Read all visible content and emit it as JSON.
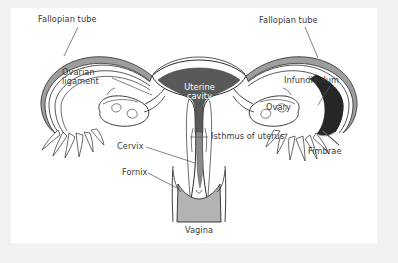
{
  "figure": {
    "kind": "anatomical-diagram",
    "background_color": "#f2f2f2",
    "paper_color": "#ffffff",
    "label_color": "#3a3a3a",
    "leader_color": "#5a5a5a",
    "outline_color": "#2b2b2b"
  },
  "labels": {
    "fallopian_tube_left": "Fallopian tube",
    "fallopian_tube_right": "Fallopian tube",
    "ovarian_ligament": "Ovarian\nligament",
    "ovarian_ligament_line1": "Ovarian",
    "ovarian_ligament_line2": "ligament",
    "uterine_cavity_line1": "Uterine",
    "uterine_cavity_line2": "cavity",
    "infundibulum": "Infundibulum",
    "ovary": "Ovary",
    "fimbrae": "Fimbrae",
    "isthmus_of_uterus": "Isthmus of uterus",
    "cervix": "Cervix",
    "fornix": "Fornix",
    "vagina": "Vagina"
  },
  "label_positions": {
    "fallopian_tube_left": {
      "x": 38,
      "y": 15
    },
    "fallopian_tube_right": {
      "x": 259,
      "y": 16
    },
    "ovarian_ligament": {
      "x": 62,
      "y": 68
    },
    "uterine_cavity": {
      "x": 175,
      "y": 86
    },
    "infundibulum": {
      "x": 286,
      "y": 76
    },
    "ovary": {
      "x": 290,
      "y": 96
    },
    "fimbrae": {
      "x": 310,
      "y": 147
    },
    "isthmus_of_uterus": {
      "x": 212,
      "y": 134
    },
    "cervix": {
      "x": 117,
      "y": 144
    },
    "fornix": {
      "x": 123,
      "y": 170
    },
    "vagina": {
      "x": 186,
      "y": 228
    }
  },
  "regions": {
    "uterine_cavity_fill": "#595959",
    "cervical_canal_fill": "#8a8a8a",
    "vagina_fill": "#b3b3b3",
    "infundibulum_dark_fill": "#262626",
    "tube_wall_fill": "#9a9a9a",
    "tube_lumen_fill": "#ffffff",
    "myometrium_fill": "#ffffff",
    "ovary_fill": "#ffffff"
  },
  "structures": [
    "Fallopian tube (left)",
    "Fallopian tube (right)",
    "Ovarian ligament",
    "Uterine cavity",
    "Infundibulum",
    "Ovary",
    "Fimbrae",
    "Isthmus of uterus",
    "Cervix",
    "Fornix",
    "Vagina"
  ]
}
